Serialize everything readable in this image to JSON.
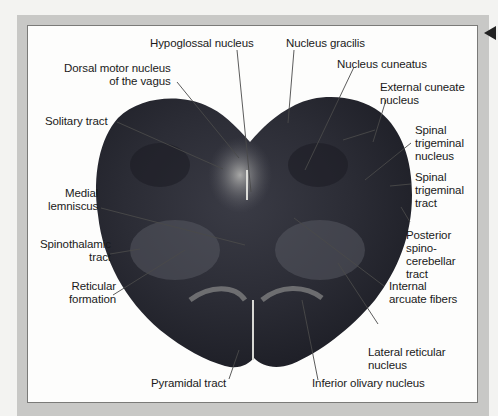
{
  "figure": {
    "colors": {
      "frame": "#c8c8c6",
      "panel": "#fdfdfc",
      "tissue_dark": "#2a2b33",
      "tissue_mid": "#4a4b55",
      "tissue_light": "#b9b9b6",
      "leader_line": "#4a4a4a"
    },
    "labels": {
      "hypoglossal_nucleus": "Hypoglossal nucleus",
      "nucleus_gracilis": "Nucleus gracilis",
      "dorsal_motor_nucleus": "Dorsal motor nucleus\n of the vagus",
      "nucleus_cuneatus": "Nucleus cuneatus",
      "external_cuneate_nucleus": "External cuneate\nnucleus",
      "solitary_tract": "Solitary tract",
      "spinal_trigeminal_nucleus": "Spinal\ntrigeminal\nnucleus",
      "spinal_trigeminal_tract": "Spinal\ntrigeminal\ntract",
      "medial_lemniscus": "Medial\nlemniscus",
      "posterior_spinocerebellar_tract": "Posterior\nspino-\ncerebellar\ntract",
      "spinothalamic_tract": "Spinothalamic\ntract",
      "reticular_formation": "Reticular\nformation",
      "internal_arcuate_fibers": "Internal\narcuate fibers",
      "lateral_reticular_nucleus": "Lateral reticular\nnucleus",
      "pyramidal_tract": "Pyramidal tract",
      "inferior_olivary_nucleus": "Inferior olivary nucleus"
    }
  }
}
